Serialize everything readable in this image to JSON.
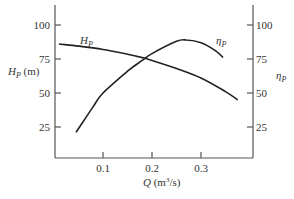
{
  "chart_data": {
    "type": "line",
    "title": "",
    "xlabel": "Q (m³/s)",
    "ylabel_left": "H_P (m)",
    "ylabel_right": "η_P",
    "x_ticks": [
      "0.1",
      "0.2",
      "0.3"
    ],
    "x_tick_values": [
      0.1,
      0.2,
      0.3
    ],
    "y_ticks_left": [
      "100",
      "75",
      "50",
      "25"
    ],
    "y_ticks_right": [
      "100",
      "75",
      "50",
      "25"
    ],
    "y_tick_values": [
      100,
      75,
      50,
      25
    ],
    "xlim": [
      0,
      0.38
    ],
    "ylim": [
      0,
      115
    ],
    "grid": false,
    "legend": "inline curve labels",
    "series": [
      {
        "name": "H_P",
        "axis": "left",
        "x": [
          0.01,
          0.05,
          0.1,
          0.15,
          0.18,
          0.2,
          0.25,
          0.3,
          0.35,
          0.375
        ],
        "values": [
          86,
          84.5,
          82,
          78.5,
          76,
          74,
          68,
          61,
          51,
          45
        ]
      },
      {
        "name": "η_P",
        "axis": "right",
        "x": [
          0.045,
          0.08,
          0.1,
          0.15,
          0.18,
          0.2,
          0.25,
          0.27,
          0.3,
          0.33,
          0.345
        ],
        "values": [
          21,
          40,
          50,
          66,
          74,
          79,
          88,
          89,
          87,
          81,
          76
        ]
      }
    ],
    "annotations": [
      {
        "text": "H_P",
        "near": "H_P curve start"
      },
      {
        "text": "η_P",
        "near": "η_P curve end"
      }
    ]
  },
  "labels": {
    "y_left_main": "H",
    "y_left_sub": "P",
    "y_left_unit": " (m)",
    "y_right_main": "η",
    "y_right_sub": "P",
    "x_main": "Q",
    "x_unit": " (m",
    "x_unit_sup": "3",
    "x_unit_end": "/s)",
    "hp_curve_main": "H",
    "hp_curve_sub": "P",
    "eta_curve_main": "η",
    "eta_curve_sub": "P"
  }
}
